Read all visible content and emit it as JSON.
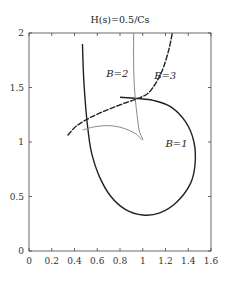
{
  "chart_data": {
    "type": "line",
    "title": "H(s)=0.5/Cs",
    "xlabel": "",
    "ylabel": "",
    "xlim": [
      0,
      1.6
    ],
    "ylim": [
      0,
      2
    ],
    "xticks": [
      "0",
      "0.2",
      "0.4",
      "0.6",
      "0.8",
      "1",
      "1.2",
      "1.4",
      "1.6"
    ],
    "yticks": [
      "0",
      "0.5",
      "1",
      "1.5",
      "2"
    ],
    "grid": false,
    "series": [
      {
        "name": "B=1",
        "color": "#222222",
        "style": "solid",
        "points": [
          [
            0.47,
            1.9
          ],
          [
            0.48,
            1.6
          ],
          [
            0.5,
            1.3
          ],
          [
            0.52,
            1.1
          ],
          [
            0.55,
            0.9
          ],
          [
            0.62,
            0.68
          ],
          [
            0.72,
            0.5
          ],
          [
            0.85,
            0.38
          ],
          [
            1.0,
            0.33
          ],
          [
            1.15,
            0.35
          ],
          [
            1.3,
            0.45
          ],
          [
            1.42,
            0.62
          ],
          [
            1.46,
            0.8
          ],
          [
            1.45,
            1.0
          ],
          [
            1.38,
            1.18
          ],
          [
            1.25,
            1.32
          ],
          [
            1.1,
            1.38
          ],
          [
            0.95,
            1.4
          ],
          [
            0.8,
            1.41
          ]
        ]
      },
      {
        "name": "B=2",
        "color": "#888888",
        "style": "solid",
        "points": [
          [
            0.92,
            2.0
          ],
          [
            0.92,
            1.7
          ],
          [
            0.93,
            1.45
          ],
          [
            0.95,
            1.25
          ],
          [
            0.97,
            1.1
          ],
          [
            1.0,
            1.02
          ],
          [
            0.93,
            1.08
          ],
          [
            0.82,
            1.13
          ],
          [
            0.7,
            1.15
          ],
          [
            0.58,
            1.14
          ],
          [
            0.47,
            1.11
          ]
        ]
      },
      {
        "name": "B=3",
        "color": "#222222",
        "style": "dashed",
        "points": [
          [
            0.34,
            1.06
          ],
          [
            0.42,
            1.15
          ],
          [
            0.55,
            1.23
          ],
          [
            0.7,
            1.3
          ],
          [
            0.85,
            1.36
          ],
          [
            0.96,
            1.4
          ],
          [
            1.05,
            1.45
          ],
          [
            1.12,
            1.55
          ],
          [
            1.18,
            1.68
          ],
          [
            1.23,
            1.85
          ],
          [
            1.26,
            2.0
          ]
        ]
      }
    ],
    "annotations": [
      {
        "text": "B=1",
        "x": 1.2,
        "y": 0.95
      },
      {
        "text": "B=2",
        "x": 0.68,
        "y": 1.6
      },
      {
        "text": "B=3",
        "x": 1.1,
        "y": 1.58
      }
    ]
  }
}
